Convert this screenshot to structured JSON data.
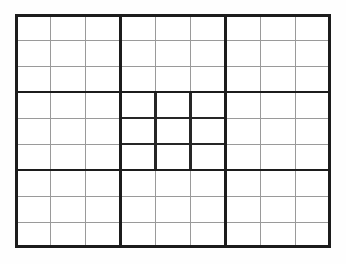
{
  "puzzle": {
    "kind": "sudoku-grid",
    "title": "Blank 9x9 Sudoku Grid",
    "columns": 9,
    "rows": 9,
    "box_columns": 3,
    "box_rows": 3,
    "boxes_across": 3,
    "boxes_down": 3,
    "emphasized_box": {
      "name": "center-box",
      "box_row": 2,
      "box_col": 2,
      "row_range": [
        4,
        6
      ],
      "col_range": [
        4,
        6
      ]
    },
    "cell_values": [
      [
        "",
        "",
        "",
        "",
        "",
        "",
        "",
        "",
        ""
      ],
      [
        "",
        "",
        "",
        "",
        "",
        "",
        "",
        "",
        ""
      ],
      [
        "",
        "",
        "",
        "",
        "",
        "",
        "",
        "",
        ""
      ],
      [
        "",
        "",
        "",
        "",
        "",
        "",
        "",
        "",
        ""
      ],
      [
        "",
        "",
        "",
        "",
        "",
        "",
        "",
        "",
        ""
      ],
      [
        "",
        "",
        "",
        "",
        "",
        "",
        "",
        "",
        ""
      ],
      [
        "",
        "",
        "",
        "",
        "",
        "",
        "",
        "",
        ""
      ],
      [
        "",
        "",
        "",
        "",
        "",
        "",
        "",
        "",
        ""
      ],
      [
        "",
        "",
        "",
        "",
        "",
        "",
        "",
        "",
        ""
      ]
    ]
  },
  "geometry": {
    "grid_left": 15,
    "grid_top": 14,
    "grid_width": 316,
    "grid_height": 234,
    "cell_width": 35.11,
    "cell_height": 26.0
  },
  "style": {
    "page_background": "#fefefe",
    "grid_background": "#ffffff",
    "thin_line_color": "#9a9a9a",
    "thick_line_color": "#1c1c1c",
    "emphasis_line_color": "#262626",
    "thin_line_width": 1,
    "thick_line_width": 2.6,
    "emphasis_line_width": 2.4,
    "border_line_width": 2.8
  }
}
